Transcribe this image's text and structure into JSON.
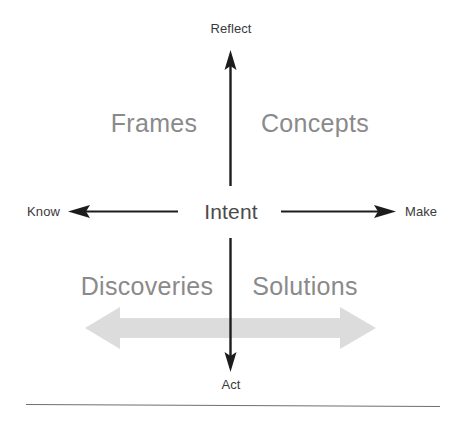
{
  "diagram": {
    "kind": "two-axis-quadrant-framework",
    "background_color": "#ffffff",
    "axes": {
      "vertical": {
        "top_label": "Reflect",
        "bottom_label": "Act",
        "line_color": "#1c1c1c"
      },
      "horizontal": {
        "left_label": "Know",
        "right_label": "Make",
        "line_color": "#1c1c1c"
      }
    },
    "center": {
      "label": "Intent",
      "color": "#4a4a4a"
    },
    "quadrants": [
      {
        "position": "top-left",
        "label": "Frames"
      },
      {
        "position": "top-right",
        "label": "Concepts"
      },
      {
        "position": "bottom-left",
        "label": "Discoveries"
      },
      {
        "position": "bottom-right",
        "label": "Solutions"
      }
    ],
    "quadrant_label_color": "#8a8a8a",
    "band": {
      "name": "bidirectional-spectrum-arrow",
      "color": "#dcdcdc",
      "direction": "both"
    },
    "footer_rule": {
      "color": "#6f6f6f"
    }
  }
}
